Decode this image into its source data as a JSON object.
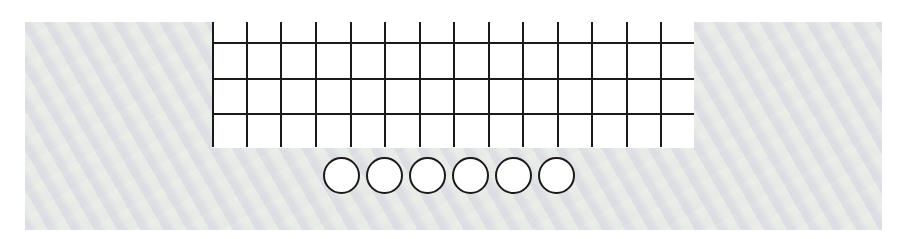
{
  "panel": {
    "background_color": "#e8ebe6"
  },
  "board": {
    "columns": 14,
    "rows": 4,
    "vertical_line_offsets": [
      0,
      34,
      68,
      103,
      138,
      172,
      207,
      241,
      276,
      310,
      345,
      379,
      414,
      448
    ],
    "horizontal_line_offsets": [
      20,
      56,
      91
    ],
    "line_color": "#1a1a1a",
    "cell_color": "#ffffff"
  },
  "pegs": {
    "count": 6,
    "offsets": [
      0,
      43,
      86,
      129,
      172,
      215
    ],
    "fill": "#ffffff",
    "stroke": "#1a1a1a"
  }
}
